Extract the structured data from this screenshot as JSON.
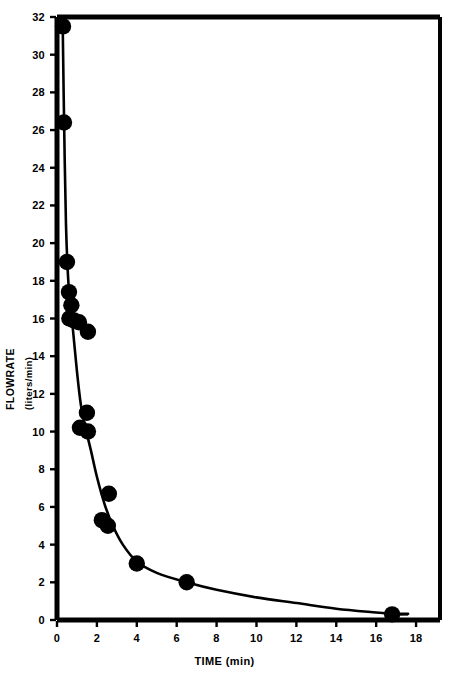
{
  "chart_data": {
    "type": "scatter",
    "title": "",
    "xlabel": "TIME (min)",
    "ylabel": "FLOWRATE",
    "ylabel_units": "(liters/min)",
    "xlim": [
      0,
      19.2
    ],
    "ylim": [
      0,
      32
    ],
    "xticks": [
      0,
      2,
      4,
      6,
      8,
      10,
      12,
      14,
      16,
      18
    ],
    "yticks": [
      0,
      2,
      4,
      6,
      8,
      10,
      12,
      14,
      16,
      18,
      20,
      22,
      24,
      26,
      28,
      30,
      32
    ],
    "xtick_labels": [
      "0",
      "2",
      "4",
      "6",
      "8",
      "10",
      "12",
      "14",
      "16",
      "18"
    ],
    "ytick_labels": [
      "0",
      "2",
      "4",
      "6",
      "8",
      "10",
      "12",
      "14",
      "16",
      "18",
      "20",
      "22",
      "24",
      "26",
      "28",
      "30",
      "32"
    ],
    "grid": false,
    "legend": null,
    "marker_color": "#000000",
    "line_color": "#000000",
    "axis_color": "#000000",
    "background_color": "#ffffff",
    "points": [
      {
        "x": 0.3,
        "y": 31.5
      },
      {
        "x": 0.35,
        "y": 26.4
      },
      {
        "x": 0.5,
        "y": 19.0
      },
      {
        "x": 0.6,
        "y": 17.4
      },
      {
        "x": 0.72,
        "y": 16.7
      },
      {
        "x": 0.62,
        "y": 16.0
      },
      {
        "x": 0.85,
        "y": 15.9
      },
      {
        "x": 1.1,
        "y": 15.8
      },
      {
        "x": 1.55,
        "y": 15.3
      },
      {
        "x": 1.5,
        "y": 11.0
      },
      {
        "x": 1.15,
        "y": 10.2
      },
      {
        "x": 1.55,
        "y": 10.0
      },
      {
        "x": 2.6,
        "y": 6.7
      },
      {
        "x": 2.25,
        "y": 5.3
      },
      {
        "x": 2.55,
        "y": 5.0
      },
      {
        "x": 4.0,
        "y": 3.0
      },
      {
        "x": 6.5,
        "y": 2.0
      },
      {
        "x": 16.8,
        "y": 0.3
      }
    ],
    "fit_curve": [
      {
        "x": 0.28,
        "y": 32.0
      },
      {
        "x": 0.34,
        "y": 27.5
      },
      {
        "x": 0.45,
        "y": 21.0
      },
      {
        "x": 0.6,
        "y": 17.4
      },
      {
        "x": 0.8,
        "y": 15.4
      },
      {
        "x": 1.0,
        "y": 13.2
      },
      {
        "x": 1.2,
        "y": 11.4
      },
      {
        "x": 1.45,
        "y": 10.1
      },
      {
        "x": 1.7,
        "y": 9.0
      },
      {
        "x": 2.0,
        "y": 7.6
      },
      {
        "x": 2.4,
        "y": 6.1
      },
      {
        "x": 2.8,
        "y": 5.0
      },
      {
        "x": 3.3,
        "y": 4.0
      },
      {
        "x": 4.0,
        "y": 3.1
      },
      {
        "x": 5.0,
        "y": 2.5
      },
      {
        "x": 6.5,
        "y": 2.0
      },
      {
        "x": 8.0,
        "y": 1.6
      },
      {
        "x": 10.0,
        "y": 1.2
      },
      {
        "x": 12.0,
        "y": 0.9
      },
      {
        "x": 14.0,
        "y": 0.6
      },
      {
        "x": 16.0,
        "y": 0.4
      },
      {
        "x": 16.8,
        "y": 0.33
      },
      {
        "x": 17.6,
        "y": 0.33
      }
    ]
  }
}
